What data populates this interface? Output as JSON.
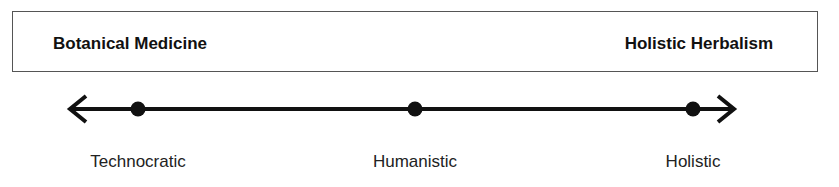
{
  "banner": {
    "left_label": "Botanical Medicine",
    "right_label": "Holistic Herbalism"
  },
  "axis": {
    "direction": "bidirectional",
    "points": [
      {
        "label": "Technocratic",
        "x": 138
      },
      {
        "label": "Humanistic",
        "x": 415
      },
      {
        "label": "Holistic",
        "x": 693
      }
    ]
  }
}
